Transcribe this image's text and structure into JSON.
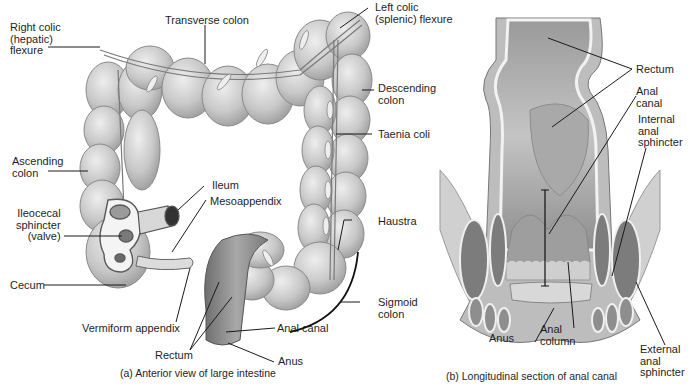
{
  "figure_a": {
    "caption": "(a) Anterior view of large intestine",
    "labels": {
      "right_colic_flexure": "Right colic\n(hepatic)\nflexure",
      "transverse_colon": "Transverse colon",
      "left_colic_flexure": "Left colic\n(splenic) flexure",
      "descending_colon": "Descending\ncolon",
      "taenia_coli": "Taenia coli",
      "ascending_colon": "Ascending\ncolon",
      "ileum": "Ileum",
      "mesoappendix": "Mesoappendix",
      "ileocecal_sphincter": "Ileocecal\nsphincter\n(valve)",
      "haustra": "Haustra",
      "cecum": "Cecum",
      "sigmoid_colon": "Sigmoid\ncolon",
      "vermiform_appendix": "Vermiform appendix",
      "anal_canal": "Anal canal",
      "rectum": "Rectum",
      "anus": "Anus"
    }
  },
  "figure_b": {
    "caption": "(b) Longitudinal section of anal canal",
    "labels": {
      "rectum": "Rectum",
      "anal_canal": "Anal\ncanal",
      "internal_anal_sphincter": "Internal\nanal\nsphincter",
      "anus": "Anus",
      "anal_column": "Anal\ncolumn",
      "external_anal_sphincter": "External\nanal\nsphincter"
    }
  },
  "colors": {
    "tissue_light": "#d9d9d9",
    "tissue_mid": "#b8b8b8",
    "tissue_dark": "#8a8a8a",
    "leader_line": "#1a1a1a"
  }
}
